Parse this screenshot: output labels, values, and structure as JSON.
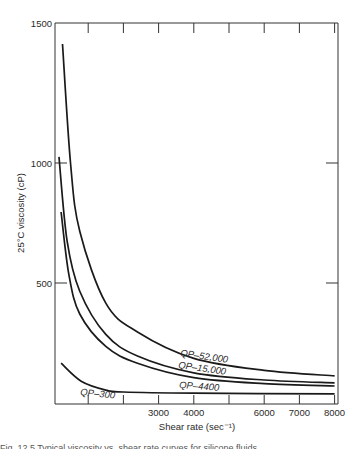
{
  "chart_data": {
    "type": "line",
    "title": "",
    "xlabel": "Shear rate (sec⁻¹)",
    "ylabel": "25°C viscosity (cP)",
    "xlim": [
      0,
      8000
    ],
    "ylim": [
      0,
      1500
    ],
    "x_ticks": [
      1000,
      2000,
      3000,
      4000,
      5000,
      6000,
      7000,
      8000
    ],
    "x_tick_labels": [
      "",
      "",
      "3000",
      "4000",
      "",
      "6000",
      "7000",
      "8000"
    ],
    "y_ticks": [
      500,
      1000,
      1500
    ],
    "y_tick_labels": [
      "500",
      "1000",
      "1500"
    ],
    "grid": false,
    "legend": "inline labels on curves",
    "series": [
      {
        "name": "QP–52,000",
        "x": [
          270,
          500,
          760,
          1500,
          2400,
          4000,
          6000,
          8000
        ],
        "values": [
          1500,
          1000,
          720,
          420,
          300,
          190,
          140,
          117
        ]
      },
      {
        "name": "QP–15,000",
        "x": [
          170,
          400,
          760,
          1500,
          2400,
          4000,
          6000,
          8000
        ],
        "values": [
          1030,
          680,
          470,
          290,
          200,
          130,
          100,
          88
        ]
      },
      {
        "name": "QP–4400",
        "x": [
          230,
          450,
          760,
          1500,
          2400,
          4000,
          6000,
          8000
        ],
        "values": [
          800,
          540,
          375,
          240,
          170,
          110,
          85,
          75
        ]
      },
      {
        "name": "QP–300",
        "x": [
          230,
          800,
          1500,
          2000,
          4000,
          8000
        ],
        "values": [
          170,
          95,
          58,
          50,
          45,
          42
        ]
      }
    ],
    "annotations": [
      "QP–52,000",
      "QP–15,000",
      "QP–4400",
      "QP–300"
    ]
  },
  "caption": "Fig. 12.5 Typical viscosity vs. shear rate curves for silicone fluids"
}
